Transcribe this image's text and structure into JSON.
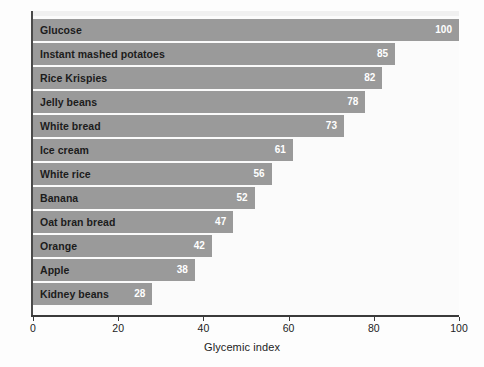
{
  "chart_data": {
    "type": "bar",
    "orientation": "horizontal",
    "title": "",
    "xlabel": "Glycemic index",
    "ylabel": "",
    "xlim": [
      0,
      100
    ],
    "xticks": [
      0,
      20,
      40,
      60,
      80,
      100
    ],
    "grid": false,
    "legend": null,
    "categories": [
      "Glucose",
      "Instant mashed potatoes",
      "Rice Krispies",
      "Jelly beans",
      "White bread",
      "Ice cream",
      "White rice",
      "Banana",
      "Oat bran bread",
      "Orange",
      "Apple",
      "Kidney beans"
    ],
    "values": [
      100,
      85,
      82,
      78,
      73,
      61,
      56,
      52,
      47,
      42,
      38,
      28
    ],
    "bars": [
      {
        "category": "Glucose",
        "value": 100,
        "value_label": "100"
      },
      {
        "category": "Instant mashed potatoes",
        "value": 85,
        "value_label": "85"
      },
      {
        "category": "Rice Krispies",
        "value": 82,
        "value_label": "82"
      },
      {
        "category": "Jelly beans",
        "value": 78,
        "value_label": "78"
      },
      {
        "category": "White bread",
        "value": 73,
        "value_label": "73"
      },
      {
        "category": "Ice cream",
        "value": 61,
        "value_label": "61"
      },
      {
        "category": "White rice",
        "value": 56,
        "value_label": "56"
      },
      {
        "category": "Banana",
        "value": 52,
        "value_label": "52"
      },
      {
        "category": "Oat bran bread",
        "value": 47,
        "value_label": "47"
      },
      {
        "category": "Orange",
        "value": 42,
        "value_label": "42"
      },
      {
        "category": "Apple",
        "value": 38,
        "value_label": "38"
      },
      {
        "category": "Kidney beans",
        "value": 28,
        "value_label": "28"
      }
    ],
    "colors": {
      "bar_fill": "#9a9a9a",
      "value_label": "#ffffff",
      "category_label": "#1c1c1c",
      "axis": "#3a3a3a",
      "plot_background": "#fbfbfb",
      "figure_background": "#fdfdfd"
    }
  }
}
